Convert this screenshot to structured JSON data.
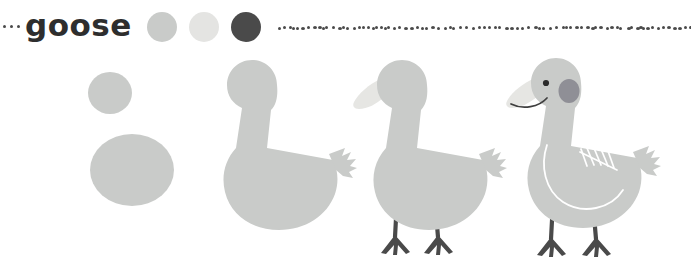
{
  "page": {
    "title": "goose",
    "background": "#ffffff"
  },
  "header": {
    "label": "goose",
    "lead_dot_count": 3,
    "swatches": [
      {
        "name": "body-gray",
        "color": "#c9cbc9"
      },
      {
        "name": "beak-white",
        "color": "#e4e4e2"
      },
      {
        "name": "ink-dark",
        "color": "#4a4a4a"
      }
    ],
    "rule": {
      "name": "dotted-rule",
      "dot_color": "#4a4a4a",
      "dot_count": 86
    }
  },
  "palette": {
    "body": "#c9cbc9",
    "body_shade": "#bfc1bf",
    "beak": "#e6e6e3",
    "ink": "#3f3f3f",
    "leg": "#4a4a4a",
    "cheek": "#8f8f96",
    "eye": "#2b2b2b",
    "detail_line": "#ffffff",
    "text": "#2e2e2e"
  },
  "tutorial": {
    "subject": "goose",
    "step_count": 4,
    "steps": [
      {
        "index": 1,
        "name": "step-shapes",
        "description": "head circle and body oval",
        "parts": [
          "head-circle",
          "body-oval"
        ]
      },
      {
        "index": 2,
        "name": "step-silhouette",
        "description": "head, neck, body and tail joined into one silhouette",
        "parts": [
          "head-neck-body-silhouette",
          "tail-feathers"
        ]
      },
      {
        "index": 3,
        "name": "step-beak-legs",
        "description": "add the beak and two webbed legs",
        "parts": [
          "body-silhouette",
          "beak",
          "left-leg",
          "right-leg",
          "webbed-feet"
        ]
      },
      {
        "index": 4,
        "name": "step-face-wing",
        "description": "add eye, cheek, smile and wing feather lines",
        "parts": [
          "body-silhouette",
          "beak",
          "eye",
          "cheek-patch",
          "smile-line",
          "wing-outline",
          "wing-feather-lines",
          "legs"
        ]
      }
    ]
  }
}
